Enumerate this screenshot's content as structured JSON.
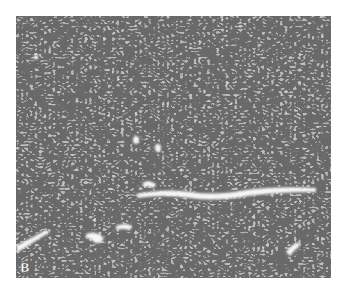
{
  "figure": {
    "type": "grayscale histology micrograph",
    "panel_label": "B",
    "colors": {
      "background": "#ffffff",
      "tissue_base": "#b4b4b4",
      "nuclei": "#2a2a2a",
      "vessel_lumen": "#f4f4f4"
    }
  }
}
